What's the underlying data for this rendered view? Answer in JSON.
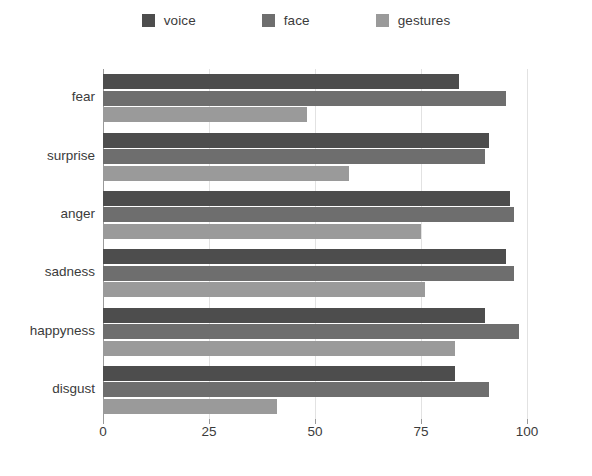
{
  "legend": {
    "items": [
      {
        "label": "voice",
        "color": "#4d4d4d"
      },
      {
        "label": "face",
        "color": "#6e6e6e"
      },
      {
        "label": "gestures",
        "color": "#9a9a9a"
      }
    ]
  },
  "chart_data": {
    "type": "bar",
    "orientation": "horizontal",
    "title": "",
    "xlabel": "",
    "ylabel": "",
    "categories": [
      "fear",
      "surprise",
      "anger",
      "sadness",
      "happyness",
      "disgust"
    ],
    "series": [
      {
        "name": "voice",
        "color": "#4d4d4d",
        "values": [
          84,
          91,
          96,
          95,
          90,
          83
        ]
      },
      {
        "name": "face",
        "color": "#6e6e6e",
        "values": [
          95,
          90,
          97,
          97,
          98,
          91
        ]
      },
      {
        "name": "gestures",
        "color": "#9a9a9a",
        "values": [
          48,
          58,
          75,
          76,
          83,
          41
        ]
      }
    ],
    "xlim": [
      0,
      100
    ],
    "xticks": [
      0,
      25,
      50,
      75,
      100
    ],
    "xticklabels": [
      "0",
      "25",
      "50",
      "75",
      "100"
    ],
    "grid": true,
    "gridlines_axis": "x",
    "legend_position": "top"
  },
  "colors": {
    "background": "#ffffff",
    "text": "#3b3b3b",
    "grid": "#e2e2e2",
    "axis": "#9a9a9a"
  }
}
